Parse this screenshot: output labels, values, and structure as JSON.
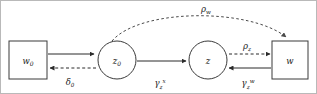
{
  "diagram": {
    "type": "graphical-model",
    "nodes": [
      {
        "id": "w0",
        "label": "w",
        "sub": "0",
        "shape": "box",
        "x": 28,
        "y": 60
      },
      {
        "id": "z0",
        "label": "z",
        "sub": "0",
        "shape": "circle",
        "x": 117,
        "y": 60
      },
      {
        "id": "z",
        "label": "z",
        "sub": "",
        "shape": "circle",
        "x": 208,
        "y": 60
      },
      {
        "id": "w",
        "label": "w",
        "sub": "",
        "shape": "box",
        "x": 290,
        "y": 60
      }
    ],
    "edges": [
      {
        "id": "w0-to-z0",
        "from": "w0",
        "to": "z0",
        "style": "solid",
        "label": "",
        "sub": "",
        "sup": ""
      },
      {
        "id": "z0-to-w0",
        "from": "z0",
        "to": "w0",
        "style": "dashed",
        "label": "δ",
        "sub": "0",
        "sup": ""
      },
      {
        "id": "z0-to-z",
        "from": "z0",
        "to": "z",
        "style": "solid",
        "label": "γ",
        "sub": "z",
        "sup": "x"
      },
      {
        "id": "w-to-z",
        "from": "w",
        "to": "z",
        "style": "solid",
        "label": "γ",
        "sub": "z",
        "sup": "w"
      },
      {
        "id": "z-to-w",
        "from": "z",
        "to": "w",
        "style": "dashed",
        "label": "ρ",
        "sub": "z",
        "sup": ""
      },
      {
        "id": "z0-to-w-arc",
        "from": "z0",
        "to": "w",
        "style": "dashed-arc",
        "label": "ρ",
        "sub": "w",
        "sup": ""
      }
    ],
    "labels": {
      "rho_w": "ρ",
      "rho_w_sub": "w",
      "rho_z": "ρ",
      "rho_z_sub": "z",
      "delta_0": "δ",
      "delta_0_sub": "0",
      "gamma_z_x": "γ",
      "gamma_z_x_sub": "z",
      "gamma_z_x_sup": "x",
      "gamma_z_w": "γ",
      "gamma_z_w_sub": "z",
      "gamma_z_w_sup": "w",
      "node_w0": "w",
      "node_w0_sub": "0",
      "node_z0": "z",
      "node_z0_sub": "0",
      "node_z": "z",
      "node_w": "w"
    },
    "colors": {
      "stroke": "#2b2b2b",
      "node_stroke": "#3a3a3a",
      "background": "#ffffff",
      "frame": "#b9b9b9"
    }
  }
}
